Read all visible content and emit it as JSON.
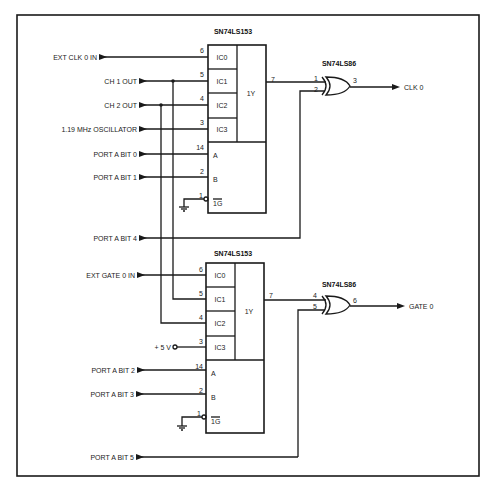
{
  "diagram": {
    "title": "",
    "colors": {
      "ink": "#1a1a1a",
      "background": "#ffffff"
    },
    "upper_mux": {
      "part": "SN74LS153",
      "cells": [
        "IC0",
        "IC1",
        "IC2",
        "IC3",
        "1Y",
        "A",
        "B",
        "1G"
      ],
      "pins": {
        "ic0": "6",
        "ic1": "5",
        "ic2": "4",
        "ic3": "3",
        "a": "14",
        "b": "2",
        "g": "1",
        "y": "7"
      }
    },
    "lower_mux": {
      "part": "SN74LS153",
      "cells": [
        "IC0",
        "IC1",
        "IC2",
        "IC3",
        "1Y",
        "A",
        "B",
        "1G"
      ],
      "pins": {
        "ic0": "6",
        "ic1": "5",
        "ic2": "4",
        "ic3": "3",
        "a": "14",
        "b": "2",
        "g": "1",
        "y": "7"
      }
    },
    "upper_xor": {
      "part": "SN74LS86",
      "pins": {
        "in1": "1",
        "in2": "2",
        "out": "3"
      },
      "output_label": "CLK 0"
    },
    "lower_xor": {
      "part": "SN74LS86",
      "pins": {
        "in1": "4",
        "in2": "5",
        "out": "6"
      },
      "output_label": "GATE 0"
    },
    "inputs": {
      "ext_clk": "EXT CLK 0 IN",
      "ch1": "CH 1 OUT",
      "ch2": "CH 2 OUT",
      "osc": "1.19 MHz OSCILLATOR",
      "pa0": "PORT A BIT 0",
      "pa1": "PORT A BIT 1",
      "pa4": "PORT A BIT 4",
      "ext_gate": "EXT GATE 0 IN",
      "vcc": "+ 5 V",
      "pa2": "PORT A BIT 2",
      "pa3": "PORT A BIT 3",
      "pa5": "PORT A BIT 5"
    }
  }
}
